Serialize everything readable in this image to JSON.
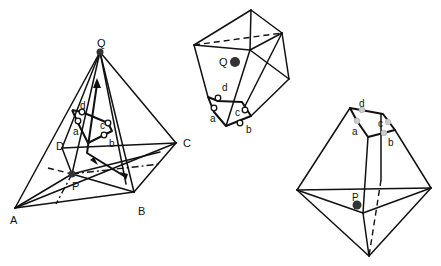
{
  "figure": {
    "panels": [
      {
        "id": "left",
        "description": "Tetrahedral pyramid with apex Q over base ABCD, interior point P and cycle a-b-c-d",
        "vertex_labels": {
          "Q": "Q",
          "A": "A",
          "B": "B",
          "C": "C",
          "D": "D",
          "P": "P"
        },
        "cycle_labels": {
          "a": "a",
          "b": "b",
          "c": "c",
          "d": "d"
        }
      },
      {
        "id": "top-middle",
        "description": "Polyhedron containing point Q with cycle a-b-c-d at bottom",
        "vertex_labels": {
          "Q": "Q"
        },
        "cycle_labels": {
          "a": "a",
          "b": "b",
          "c": "c",
          "d": "d"
        }
      },
      {
        "id": "right",
        "description": "Bipyramid containing point P with cycle a-b-c-d at top",
        "vertex_labels": {
          "P": "P"
        },
        "cycle_labels": {
          "a": "a",
          "b": "b",
          "c": "c",
          "d": "d"
        }
      }
    ]
  }
}
